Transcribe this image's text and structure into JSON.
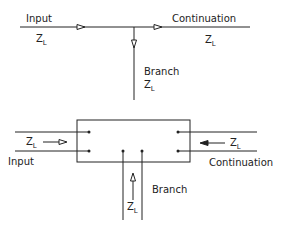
{
  "top_diagram": {
    "input_label": "Input",
    "input_impedance": "Z",
    "input_impedance_sub": "L",
    "continuation_label": "Continuation",
    "continuation_impedance": "Z",
    "continuation_impedance_sub": "L",
    "branch_label": "Branch",
    "branch_impedance": "Z",
    "branch_impedance_sub": "L"
  },
  "bottom_diagram": {
    "input_label": "Input",
    "input_impedance": "Z",
    "input_impedance_sub": "L",
    "continuation_label": "Continuation",
    "continuation_impedance": "Z",
    "continuation_impedance_sub": "L",
    "branch_label": "Branch",
    "branch_impedance": "Z",
    "branch_impedance_sub": "L"
  },
  "colors": {
    "line": "#222222",
    "background": "#ffffff"
  }
}
